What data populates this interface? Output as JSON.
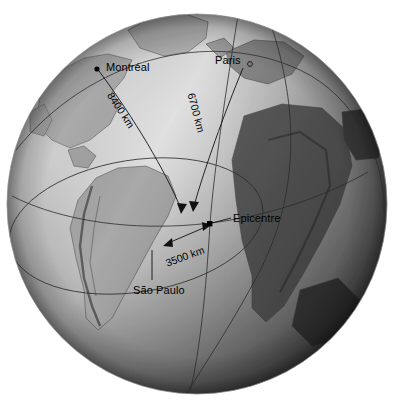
{
  "figure": {
    "type": "globe-diagram",
    "background_color": "#ffffff",
    "ink_color": "#1a1a1a"
  },
  "globe": {
    "name": "earth-globe",
    "center_x": 197,
    "center_y": 204,
    "radius": 190,
    "projection": "orthographic",
    "shading": "grayscale shaded relief, lit from upper-left",
    "highlight_color": "#ffffff",
    "midtone_color": "#b9b9b9",
    "shadow_color": "#3c3c3c",
    "land_color": "#8f8f8f",
    "visible_regions": [
      "North America",
      "South America",
      "Europe",
      "Africa",
      "Greenland",
      "Atlantic Ocean"
    ]
  },
  "markers": [
    {
      "id": "montreal",
      "label": "Montréal",
      "x": 97,
      "y": 69,
      "label_x": 106,
      "label_y": 63,
      "marker": "filled-dot"
    },
    {
      "id": "paris",
      "label": "Paris",
      "x": 250,
      "y": 64,
      "label_x": 215,
      "label_y": 56,
      "marker": "open-circle"
    },
    {
      "id": "epicentre",
      "label": "Epicentre",
      "x": 210,
      "y": 224,
      "label_x": 232,
      "label_y": 214,
      "marker": "filled-square"
    },
    {
      "id": "saopaulo",
      "label": "São Paulo",
      "x": 150,
      "y": 288,
      "label_x": 133,
      "label_y": 286,
      "marker": "none"
    }
  ],
  "distances": [
    {
      "id": "montreal-epicentre",
      "label": "8400 km",
      "from": "Montréal",
      "to": "Epicentre",
      "value": 8400,
      "unit": "km",
      "text_x": 110,
      "text_y": 88,
      "rotation": 57
    },
    {
      "id": "paris-epicentre",
      "label": "6700 km",
      "from": "Paris",
      "to": "Epicentre",
      "value": 6700,
      "unit": "km",
      "text_x": 190,
      "text_y": 90,
      "rotation": 75
    },
    {
      "id": "saopaulo-epicentre",
      "label": "3500 km",
      "from": "São Paulo",
      "to": "Epicentre",
      "value": 3500,
      "unit": "km",
      "text_x": 166,
      "text_y": 258,
      "rotation": -20
    }
  ],
  "annotations": {
    "leader_line": "Epicentre callout leader",
    "wavefront_ring": "3500 km constant-distance ring drawn around the epicentre"
  }
}
